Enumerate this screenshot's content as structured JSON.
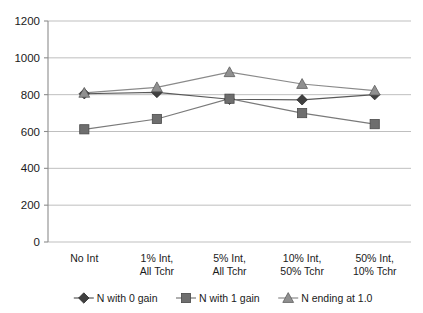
{
  "chart_data": {
    "type": "line",
    "title": "",
    "subtitle": "",
    "xlabel": "",
    "ylabel": "",
    "categories": [
      "No Int",
      "1% Int,\nAll Tchr",
      "5% Int,\nAll Tchr",
      "10% Int,\n50% Tchr",
      "50% Int,\n10% Tchr"
    ],
    "category_lines": [
      [
        "No Int",
        ""
      ],
      [
        "1% Int,",
        "All Tchr"
      ],
      [
        "5% Int,",
        "All Tchr"
      ],
      [
        "10% Int,",
        "50% Tchr"
      ],
      [
        "50% Int,",
        "10% Tchr"
      ]
    ],
    "series": [
      {
        "name": "N with 0 gain",
        "marker": "diamond",
        "color": "#404040",
        "line_color": "#595959",
        "values": [
          805,
          812,
          775,
          772,
          800
        ]
      },
      {
        "name": "N with 1 gain",
        "marker": "square",
        "color": "#6e6e6e",
        "line_color": "#7a7a7a",
        "values": [
          612,
          668,
          778,
          700,
          640
        ]
      },
      {
        "name": "N ending at 1.0",
        "marker": "triangle",
        "color": "#909090",
        "line_color": "#8a8a8a",
        "values": [
          810,
          840,
          922,
          858,
          822
        ]
      }
    ],
    "ylim": [
      0,
      1200
    ],
    "yticks": [
      0,
      200,
      400,
      600,
      800,
      1000,
      1200
    ],
    "ytick_labels": [
      "0",
      "200",
      "400",
      "600",
      "800",
      "1000",
      "1200"
    ],
    "grid": true,
    "grid_axis": "y",
    "legend_position": "bottom",
    "legend": [
      "N with 0 gain",
      "N with 1 gain",
      "N ending at 1.0"
    ]
  },
  "colors": {
    "gridline": "#b8b8b8",
    "axis": "#8c8c8c",
    "text": "#1a1a1a",
    "background": "#ffffff"
  }
}
